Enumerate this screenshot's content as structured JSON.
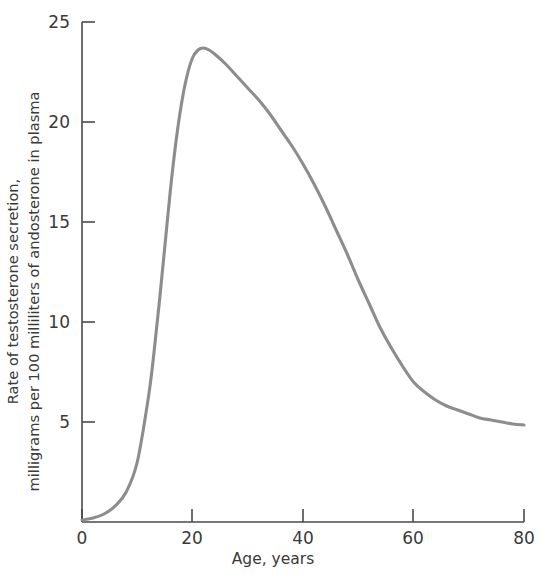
{
  "chart_data": {
    "type": "line",
    "title": "",
    "subtitle": "",
    "xlabel": "Age, years",
    "ylabel_line1": "Rate of testosterone secretion,",
    "ylabel_line2": "milligrams per 100 milliliters of andosterone in plasma",
    "xlim": [
      0,
      80
    ],
    "ylim": [
      0,
      25
    ],
    "xticks": [
      0,
      20,
      40,
      60,
      80
    ],
    "xtick_labels": [
      "0",
      "20",
      "40",
      "60",
      "80"
    ],
    "yticks": [
      0,
      5,
      10,
      15,
      20,
      25
    ],
    "ytick_labels": [
      "",
      "5",
      "10",
      "15",
      "20",
      "25"
    ],
    "grid": false,
    "legend": null,
    "legend_position": "none",
    "line_color": "#8d8d8d",
    "axis_color": "#4a4a4a",
    "series": [
      {
        "name": "Testosterone secretion rate",
        "x": [
          0,
          2,
          4,
          6,
          8,
          10,
          12,
          13,
          14,
          15,
          16,
          17,
          18,
          19,
          20,
          21,
          22,
          23,
          24,
          26,
          28,
          30,
          32,
          34,
          36,
          38,
          40,
          42,
          44,
          46,
          48,
          50,
          52,
          54,
          56,
          58,
          60,
          62,
          64,
          66,
          68,
          70,
          72,
          74,
          76,
          78,
          80
        ],
        "y": [
          0.1,
          0.2,
          0.4,
          0.8,
          1.5,
          3.0,
          6.2,
          8.4,
          11.0,
          13.8,
          16.6,
          19.0,
          20.9,
          22.3,
          23.2,
          23.6,
          23.7,
          23.6,
          23.4,
          22.9,
          22.3,
          21.7,
          21.1,
          20.4,
          19.6,
          18.8,
          17.9,
          16.9,
          15.8,
          14.6,
          13.4,
          12.1,
          10.9,
          9.7,
          8.7,
          7.8,
          7.0,
          6.5,
          6.1,
          5.8,
          5.6,
          5.4,
          5.2,
          5.1,
          5.0,
          4.9,
          4.85
        ]
      }
    ],
    "annotations": [],
    "peak": {
      "x": 22,
      "y": 23.7
    }
  },
  "axis": {
    "y_tick_25": "25",
    "y_tick_20": "20",
    "y_tick_15": "15",
    "y_tick_10": "10",
    "y_tick_5": "5",
    "x_tick_0": "0",
    "x_tick_20": "20",
    "x_tick_40": "40",
    "x_tick_60": "60",
    "x_tick_80": "80"
  }
}
